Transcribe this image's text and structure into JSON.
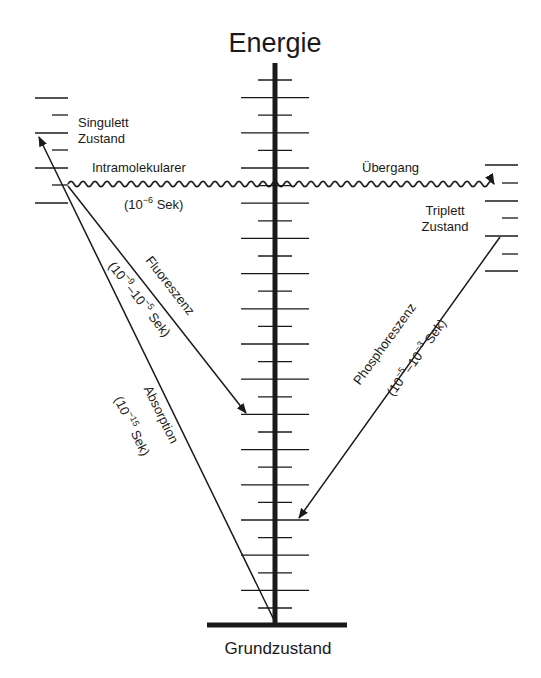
{
  "title": "Energie",
  "ground_state": "Grundzustand",
  "singlet": {
    "line1": "Singulett",
    "line2": "Zustand"
  },
  "triplet": {
    "line1": "Triplett",
    "line2": "Zustand"
  },
  "intersystem": {
    "left": "Intramolekularer",
    "right": "Übergang",
    "time_prefix": "(10",
    "time_exp": "−6",
    "time_suffix": " Sek)"
  },
  "fluorescence": {
    "label": "Fluoreszenz",
    "t_open": "(10",
    "t_exp1": "−9",
    "t_mid": "–10",
    "t_exp2": "−5",
    "t_close": " Sek)"
  },
  "absorption": {
    "label": "Absorption",
    "t_open": "(10",
    "t_exp": "−15",
    "t_close": " Sek)"
  },
  "phosphorescence": {
    "label": "Phosphoreszenz",
    "t_open": "(10",
    "t_exp1": "−5",
    "t_mid": "–10",
    "t_exp2": "−3",
    "t_close": " Sek)"
  },
  "colors": {
    "ink": "#1a1a1a",
    "background": "#ffffff"
  }
}
